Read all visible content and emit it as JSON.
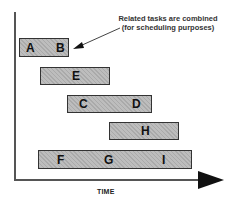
{
  "annotation": {
    "line1": "Related tasks are combined",
    "line2": "(for scheduling purposes)"
  },
  "axis": {
    "x_label": "TIME"
  },
  "tasks": [
    {
      "labels": [
        "A",
        "B"
      ]
    },
    {
      "labels": [
        "E"
      ]
    },
    {
      "labels": [
        "C",
        "D"
      ]
    },
    {
      "labels": [
        "H"
      ]
    },
    {
      "labels": [
        "F",
        "G",
        "I"
      ]
    }
  ]
}
